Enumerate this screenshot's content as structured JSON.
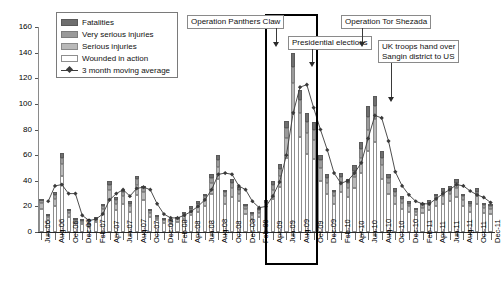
{
  "chart_data": {
    "type": "bar",
    "stacked": true,
    "title": "",
    "xlabel": "",
    "ylabel": "",
    "ylim": [
      0,
      160
    ],
    "ytick_step": 20,
    "yticks": [
      0,
      20,
      40,
      60,
      80,
      100,
      120,
      140,
      160
    ],
    "grid": false,
    "legend_position": "top-left",
    "categories": [
      "Jun-06",
      "Jul-06",
      "Aug-06",
      "Sep-06",
      "Oct-06",
      "Nov-06",
      "Dec-06",
      "Jan-07",
      "Feb-07",
      "Mar-07",
      "Apr-07",
      "May-07",
      "Jun-07",
      "Jul-07",
      "Aug-07",
      "Sep-07",
      "Oct-07",
      "Nov-07",
      "Dec-07",
      "Jan-08",
      "Feb-08",
      "Mar-08",
      "Apr-08",
      "May-08",
      "Jun-08",
      "Jul-08",
      "Aug-08",
      "Sep-08",
      "Oct-08",
      "Nov-08",
      "Dec-08",
      "Jan-09",
      "Feb-09",
      "Mar-09",
      "Apr-09",
      "May-09",
      "Jun-09",
      "Jul-09",
      "Aug-09",
      "Sep-09",
      "Oct-09",
      "Nov-09",
      "Dec-09",
      "Jan-10",
      "Feb-10",
      "Mar-10",
      "Apr-10",
      "May-10",
      "Jun-10",
      "Jul-10",
      "Aug-10",
      "Sep-10",
      "Oct-10",
      "Nov-10",
      "Dec-10",
      "Jan-11",
      "Feb-11",
      "Mar-11",
      "Apr-11",
      "May-11",
      "Jun-11",
      "Jul-11",
      "Aug-11",
      "Sep-11",
      "Oct-11",
      "Nov-11",
      "Dec-11"
    ],
    "tick_labels_every": 2,
    "series": [
      {
        "name": "Wounded in action",
        "color": "#ffffff",
        "values": [
          18,
          9,
          20,
          44,
          12,
          7,
          6,
          4,
          8,
          14,
          26,
          17,
          22,
          16,
          29,
          25,
          12,
          9,
          7,
          6,
          8,
          10,
          13,
          16,
          20,
          30,
          41,
          22,
          27,
          24,
          14,
          10,
          12,
          17,
          26,
          35,
          58,
          92,
          74,
          61,
          57,
          40,
          30,
          22,
          31,
          27,
          34,
          46,
          63,
          70,
          41,
          30,
          22,
          18,
          16,
          13,
          15,
          17,
          20,
          22,
          24,
          27,
          20,
          16,
          22,
          15,
          14
        ]
      },
      {
        "name": "Serious injuries",
        "color": "#b9b9b9",
        "values": [
          5,
          3,
          6,
          9,
          3,
          2,
          2,
          1,
          2,
          4,
          7,
          5,
          6,
          4,
          8,
          6,
          3,
          2,
          2,
          2,
          2,
          3,
          3,
          4,
          5,
          8,
          10,
          6,
          7,
          6,
          4,
          3,
          3,
          4,
          7,
          9,
          15,
          24,
          19,
          16,
          15,
          10,
          8,
          6,
          8,
          7,
          9,
          12,
          17,
          18,
          11,
          8,
          6,
          5,
          4,
          3,
          4,
          4,
          5,
          6,
          6,
          7,
          5,
          4,
          6,
          4,
          4
        ]
      },
      {
        "name": "Very serious injuries",
        "color": "#9a9a9a",
        "values": [
          2,
          1,
          3,
          5,
          2,
          1,
          1,
          1,
          1,
          2,
          4,
          3,
          3,
          2,
          4,
          3,
          2,
          1,
          1,
          1,
          1,
          2,
          2,
          2,
          3,
          4,
          5,
          3,
          4,
          3,
          2,
          2,
          2,
          2,
          4,
          5,
          8,
          13,
          10,
          9,
          8,
          6,
          4,
          3,
          4,
          4,
          5,
          7,
          10,
          10,
          6,
          4,
          3,
          3,
          2,
          2,
          2,
          2,
          3,
          3,
          3,
          4,
          3,
          2,
          3,
          2,
          2
        ]
      },
      {
        "name": "Fatalities",
        "color": "#6e6e6e",
        "values": [
          1,
          1,
          2,
          4,
          1,
          1,
          1,
          1,
          1,
          2,
          3,
          2,
          2,
          2,
          3,
          2,
          1,
          1,
          1,
          1,
          1,
          1,
          2,
          2,
          2,
          3,
          4,
          2,
          3,
          2,
          2,
          1,
          2,
          2,
          3,
          4,
          6,
          11,
          8,
          7,
          6,
          4,
          3,
          2,
          3,
          3,
          4,
          5,
          8,
          8,
          5,
          3,
          3,
          2,
          2,
          1,
          2,
          2,
          2,
          3,
          3,
          3,
          2,
          2,
          3,
          2,
          2
        ]
      }
    ],
    "totals": [
      26,
      14,
      31,
      62,
      18,
      11,
      10,
      7,
      12,
      22,
      40,
      27,
      33,
      24,
      44,
      36,
      18,
      13,
      11,
      10,
      12,
      16,
      20,
      24,
      30,
      45,
      60,
      33,
      41,
      35,
      22,
      16,
      19,
      25,
      40,
      53,
      87,
      140,
      111,
      93,
      86,
      60,
      45,
      33,
      46,
      41,
      52,
      70,
      98,
      106,
      63,
      45,
      34,
      29,
      24,
      19,
      23,
      25,
      30,
      34,
      36,
      41,
      30,
      24,
      34,
      23,
      22
    ],
    "moving_average": {
      "name": "3 month moving average",
      "color": "#3a3a3a",
      "values": [
        null,
        24,
        36,
        37,
        30,
        30,
        13,
        9,
        10,
        14,
        25,
        30,
        33,
        28,
        34,
        35,
        33,
        22,
        14,
        11,
        11,
        13,
        16,
        20,
        25,
        33,
        45,
        46,
        45,
        36,
        33,
        24,
        19,
        20,
        28,
        39,
        60,
        93,
        113,
        115,
        97,
        80,
        64,
        46,
        38,
        40,
        46,
        54,
        73,
        91,
        89,
        71,
        47,
        36,
        29,
        24,
        22,
        22,
        26,
        30,
        33,
        37,
        36,
        32,
        29,
        27,
        23
      ]
    },
    "legend": [
      {
        "label": "Fatalities",
        "swatch": "dark-grey"
      },
      {
        "label": "Very serious injuries",
        "swatch": "mid-grey"
      },
      {
        "label": "Serious injuries",
        "swatch": "light-grey"
      },
      {
        "label": "Wounded in action",
        "swatch": "white"
      },
      {
        "label": "3 month moving average",
        "swatch": "line-marker"
      }
    ],
    "annotations": [
      {
        "id": "panthers-claw",
        "text": "Operation Panthers Claw"
      },
      {
        "id": "presidential-elections",
        "text": "Presidential elections"
      },
      {
        "id": "tor-shezada",
        "text": "Operation Tor Shezada"
      },
      {
        "id": "sangin-handover",
        "text": "UK troops hand over\nSangin district to US",
        "line1": "UK troops hand over",
        "line2": "Sangin district to US"
      }
    ],
    "highlight_box": {
      "from": "Jun-09",
      "to": "Oct-09"
    }
  }
}
